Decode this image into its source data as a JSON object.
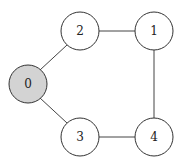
{
  "graph": {
    "nodes": [
      {
        "id": "0",
        "label": "0",
        "x": 28,
        "y": 84,
        "fill": "#d3d3d3"
      },
      {
        "id": "1",
        "label": "1",
        "x": 154,
        "y": 31,
        "fill": "#ffffff"
      },
      {
        "id": "2",
        "label": "2",
        "x": 80,
        "y": 31,
        "fill": "#ffffff"
      },
      {
        "id": "3",
        "label": "3",
        "x": 80,
        "y": 137,
        "fill": "#ffffff"
      },
      {
        "id": "4",
        "label": "4",
        "x": 154,
        "y": 137,
        "fill": "#ffffff"
      }
    ],
    "edges": [
      {
        "from": "0",
        "to": "2"
      },
      {
        "from": "0",
        "to": "3"
      },
      {
        "from": "2",
        "to": "1"
      },
      {
        "from": "1",
        "to": "4"
      },
      {
        "from": "3",
        "to": "4"
      }
    ],
    "node_radius": 19
  }
}
